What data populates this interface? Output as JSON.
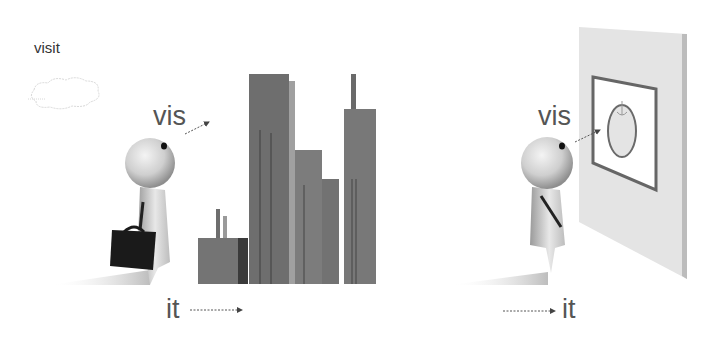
{
  "labels": {
    "visit": "visit",
    "vis_left": "vis",
    "vis_right": "vis",
    "it_left": "it",
    "it_right": "it"
  },
  "scenes": [
    {
      "name": "city-scene",
      "description": "figure with briefcase walking toward city skyline"
    },
    {
      "name": "painting-scene",
      "description": "figure looking at framed picture on wall"
    }
  ],
  "colors": {
    "text": "#555555",
    "building_dark": "#6e6e6e",
    "building_mid": "#7c7c7c",
    "building_light": "#9a9a9a",
    "wall": "#e2e2e2",
    "frame": "#666666",
    "briefcase": "#1a1a1a"
  }
}
